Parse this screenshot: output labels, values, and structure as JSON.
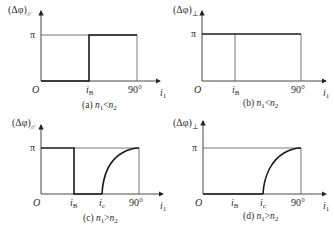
{
  "figure": {
    "panels": [
      {
        "id": "a",
        "ylabel": "(Δφ)",
        "ylabel_sub": "//",
        "ytick": "π",
        "origin": "O",
        "xticks": [
          "i",
          "90°"
        ],
        "xtick_subs": [
          "B",
          ""
        ],
        "xlabel": "i",
        "xlabel_sub": "1",
        "caption_prefix": "(a) ",
        "caption_n1": "n",
        "caption_n1_sub": "1",
        "caption_rel": "<",
        "caption_n2": "n",
        "caption_n2_sub": "2"
      },
      {
        "id": "b",
        "ylabel": "(Δφ)",
        "ylabel_sub": "⊥",
        "ytick": "π",
        "origin": "O",
        "xticks": [
          "i",
          "90°"
        ],
        "xtick_subs": [
          "B",
          ""
        ],
        "xlabel": "i",
        "xlabel_sub": "1",
        "caption_prefix": "(b) ",
        "caption_n1": "n",
        "caption_n1_sub": "1",
        "caption_rel": "<",
        "caption_n2": "n",
        "caption_n2_sub": "2"
      },
      {
        "id": "c",
        "ylabel": "(Δφ)",
        "ylabel_sub": "//",
        "ytick": "π",
        "origin": "O",
        "xticks": [
          "i",
          "i",
          "90°"
        ],
        "xtick_subs": [
          "B",
          "c",
          ""
        ],
        "xlabel": "i",
        "xlabel_sub": "1",
        "caption_prefix": "(c) ",
        "caption_n1": "n",
        "caption_n1_sub": "1",
        "caption_rel": ">",
        "caption_n2": "n",
        "caption_n2_sub": "2"
      },
      {
        "id": "d",
        "ylabel": "(Δφ)",
        "ylabel_sub": "⊥",
        "ytick": "π",
        "origin": "O",
        "xticks": [
          "i",
          "i",
          "90°"
        ],
        "xtick_subs": [
          "B",
          "c",
          ""
        ],
        "xlabel": "i",
        "xlabel_sub": "1",
        "caption_prefix": "(d) ",
        "caption_n1": "n",
        "caption_n1_sub": "1",
        "caption_rel": ">",
        "caption_n2": "n",
        "caption_n2_sub": "2"
      }
    ]
  }
}
